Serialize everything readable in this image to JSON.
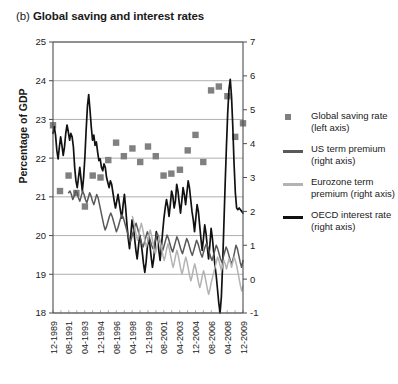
{
  "figure": {
    "panel_letter": "(b)",
    "title": "Global saving and interest rates"
  },
  "axes": {
    "left_axis_label": "Percentage of GDP",
    "left_ticks": [
      "25",
      "24",
      "23",
      "22",
      "21",
      "20",
      "19",
      "18"
    ],
    "right_ticks": [
      "7",
      "6",
      "5",
      "4",
      "3",
      "2",
      "1",
      "0",
      "-1"
    ],
    "x_ticks": [
      "12-1989",
      "08-1991",
      "04-1993",
      "12-1994",
      "08-1996",
      "04-1998",
      "12-1999",
      "08-2001",
      "04-2003",
      "12-2004",
      "08-2006",
      "04-2008",
      "12-2009"
    ]
  },
  "legend": {
    "items": [
      {
        "label_line1": "Global saving rate",
        "label_line2": "(left axis)",
        "key": "square-marker",
        "color": "#808080"
      },
      {
        "label_line1": "US term premium",
        "label_line2": "(right axis)",
        "key": "line",
        "color": "#595959"
      },
      {
        "label_line1": "Eurozone term",
        "label_line2": "premium (right axis)",
        "key": "line",
        "color": "#b3b3b3"
      },
      {
        "label_line1": "OECD interest rate",
        "label_line2": "(right axis)",
        "key": "line",
        "color": "#111111"
      }
    ]
  },
  "colors": {
    "global_saving": "#808080",
    "us_term_premium": "#595959",
    "eurozone_term_premium": "#b3b3b3",
    "oecd_interest_rate": "#111111",
    "grid": "#9a9a9a",
    "axis": "#4d4d4d"
  },
  "chart_data": {
    "type": "line",
    "title": "(b) Global saving and interest rates",
    "xlabel": "",
    "ylabel": "Percentage of GDP",
    "y2label": "",
    "ylim": [
      18,
      25
    ],
    "y2lim": [
      -1,
      7
    ],
    "grid": true,
    "legend_position": "right",
    "x_tick_labels": [
      "12-1989",
      "08-1991",
      "04-1993",
      "12-1994",
      "08-1996",
      "04-1998",
      "12-1999",
      "08-2001",
      "04-2003",
      "12-2004",
      "08-2006",
      "04-2008",
      "12-2009"
    ],
    "x_tick_positions": [
      0,
      20,
      41,
      61,
      81,
      102,
      122,
      142,
      163,
      183,
      203,
      224,
      244
    ],
    "x_range": [
      0,
      244
    ],
    "series": [
      {
        "name": "Global saving rate (left axis)",
        "axis": "left",
        "type": "scatter",
        "marker": "square",
        "color": "#808080",
        "points": [
          {
            "x": 0,
            "y": 22.85
          },
          {
            "x": 9,
            "y": 21.15
          },
          {
            "x": 20,
            "y": 21.55
          },
          {
            "x": 30,
            "y": 21.1
          },
          {
            "x": 41,
            "y": 20.75
          },
          {
            "x": 51,
            "y": 21.55
          },
          {
            "x": 61,
            "y": 21.5
          },
          {
            "x": 71,
            "y": 21.95
          },
          {
            "x": 81,
            "y": 22.4
          },
          {
            "x": 91,
            "y": 22.05
          },
          {
            "x": 102,
            "y": 22.25
          },
          {
            "x": 112,
            "y": 21.9
          },
          {
            "x": 122,
            "y": 22.3
          },
          {
            "x": 132,
            "y": 22.05
          },
          {
            "x": 142,
            "y": 21.55
          },
          {
            "x": 152,
            "y": 21.6
          },
          {
            "x": 163,
            "y": 21.7
          },
          {
            "x": 173,
            "y": 22.2
          },
          {
            "x": 183,
            "y": 22.6
          },
          {
            "x": 193,
            "y": 21.9
          },
          {
            "x": 203,
            "y": 23.75
          },
          {
            "x": 213,
            "y": 23.85
          },
          {
            "x": 224,
            "y": 23.6
          },
          {
            "x": 234,
            "y": 22.55
          },
          {
            "x": 244,
            "y": 22.9
          }
        ]
      },
      {
        "name": "OECD interest rate (right axis)",
        "axis": "right",
        "type": "line",
        "color": "#111111",
        "values": [
          4.3,
          4.5,
          4.25,
          3.8,
          3.55,
          3.9,
          4.2,
          3.95,
          3.65,
          3.9,
          4.3,
          4.55,
          4.35,
          4.1,
          4.3,
          4.2,
          3.9,
          3.3,
          2.9,
          2.7,
          3.0,
          3.3,
          2.95,
          2.6,
          3.0,
          3.6,
          4.4,
          5.1,
          5.45,
          5.0,
          4.5,
          4.1,
          4.25,
          3.95,
          4.05,
          3.75,
          3.5,
          3.55,
          3.3,
          3.2,
          3.4,
          3.3,
          3.0,
          2.85,
          2.7,
          2.9,
          2.8,
          2.55,
          2.3,
          2.1,
          2.3,
          2.5,
          2.25,
          2.0,
          1.8,
          2.2,
          2.5,
          2.1,
          1.6,
          1.2,
          0.9,
          1.3,
          1.75,
          1.55,
          1.2,
          0.85,
          0.6,
          0.95,
          1.3,
          1.1,
          0.8,
          0.45,
          0.2,
          0.5,
          0.95,
          1.25,
          1.0,
          0.65,
          0.35,
          0.6,
          1.0,
          1.4,
          1.2,
          0.85,
          0.55,
          0.95,
          1.4,
          1.8,
          2.1,
          2.35,
          2.15,
          1.85,
          2.2,
          2.6,
          2.45,
          2.1,
          2.3,
          2.8,
          2.6,
          2.25,
          1.95,
          2.3,
          2.7,
          2.5,
          2.2,
          2.55,
          2.9,
          2.7,
          2.35,
          2.0,
          1.75,
          1.4,
          1.8,
          2.2,
          2.0,
          1.6,
          1.2,
          0.85,
          1.2,
          1.6,
          1.35,
          0.95,
          0.6,
          1.0,
          1.5,
          1.2,
          0.8,
          0.4,
          0.1,
          -0.3,
          -0.7,
          -1.0,
          -0.55,
          0.4,
          1.6,
          2.8,
          3.9,
          4.9,
          5.6,
          5.9,
          5.4,
          4.5,
          3.4,
          2.55,
          2.1,
          2.05,
          2.1,
          2.05,
          2.0,
          1.95
        ]
      },
      {
        "name": "US term premium (right axis)",
        "axis": "right",
        "type": "line",
        "color": "#595959",
        "start_x": 20,
        "values": [
          2.55,
          2.6,
          2.5,
          2.35,
          2.45,
          2.6,
          2.55,
          2.4,
          2.3,
          2.45,
          2.6,
          2.5,
          2.35,
          2.25,
          2.4,
          2.55,
          2.45,
          2.3,
          2.2,
          2.35,
          2.5,
          2.4,
          2.2,
          2.0,
          1.8,
          1.6,
          1.45,
          1.55,
          1.7,
          1.85,
          1.95,
          1.85,
          1.7,
          1.55,
          1.4,
          1.5,
          1.65,
          1.8,
          1.9,
          1.8,
          1.65,
          1.5,
          1.35,
          1.2,
          1.1,
          1.25,
          1.4,
          1.55,
          1.65,
          1.5,
          1.35,
          1.2,
          1.05,
          0.95,
          1.1,
          1.25,
          1.4,
          1.3,
          1.15,
          1.0,
          0.9,
          1.05,
          1.2,
          1.35,
          1.25,
          1.1,
          0.95,
          0.85,
          1.0,
          1.15,
          1.3,
          1.2,
          1.05,
          0.9,
          0.8,
          0.95,
          1.1,
          1.25,
          1.15,
          1.0,
          0.85,
          0.75,
          0.9,
          1.05,
          1.2,
          1.1,
          0.95,
          0.8,
          0.7,
          0.85,
          1.0,
          1.15,
          1.05,
          0.9,
          0.75,
          0.65,
          0.8,
          0.95,
          1.05,
          0.95,
          0.8,
          0.65,
          0.55,
          0.7,
          0.85,
          1.0,
          0.9,
          0.75,
          0.6,
          0.5,
          0.65,
          0.8,
          0.95,
          0.85,
          0.7,
          0.55,
          0.45,
          0.6,
          0.8,
          1.0,
          0.9,
          0.7,
          0.5,
          0.35,
          0.55
        ]
      },
      {
        "name": "Eurozone term premium (right axis)",
        "axis": "right",
        "type": "line",
        "color": "#b3b3b3",
        "start_x": 102,
        "values": [
          1.85,
          1.7,
          1.5,
          1.3,
          1.15,
          1.3,
          1.5,
          1.65,
          1.5,
          1.3,
          1.1,
          0.95,
          1.1,
          1.3,
          1.45,
          1.3,
          1.1,
          0.9,
          0.75,
          0.9,
          1.1,
          1.25,
          1.1,
          0.9,
          0.7,
          0.55,
          0.7,
          0.9,
          1.05,
          0.9,
          0.7,
          0.5,
          0.35,
          0.5,
          0.7,
          0.85,
          0.7,
          0.5,
          0.3,
          0.15,
          0.3,
          0.5,
          0.65,
          0.5,
          0.3,
          0.1,
          -0.05,
          0.1,
          0.3,
          0.45,
          0.3,
          0.1,
          -0.1,
          -0.25,
          -0.1,
          0.1,
          0.25,
          0.1,
          -0.1,
          -0.3,
          -0.45,
          -0.3,
          -0.1,
          0.05,
          0.2,
          0.35,
          0.5,
          0.65,
          0.55,
          0.4,
          0.25,
          0.4,
          0.55,
          0.45,
          0.3,
          0.45,
          0.6,
          0.5,
          0.35,
          0.5,
          0.65,
          0.55,
          0.4,
          0.2,
          0.0,
          -0.2,
          -0.35,
          -0.2
        ]
      }
    ]
  }
}
